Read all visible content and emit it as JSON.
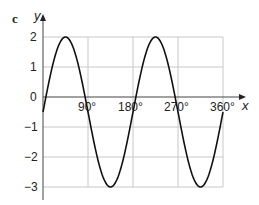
{
  "part_label": "c",
  "chart_data": {
    "type": "line",
    "title": "",
    "xlabel": "x",
    "ylabel": "y",
    "x_ticks": [
      "90°",
      "180°",
      "270°",
      "360°"
    ],
    "y_ticks": [
      "2",
      "1",
      "0",
      "−1",
      "−2",
      "−3"
    ],
    "xlim": [
      0,
      360
    ],
    "ylim": [
      -3,
      2
    ],
    "grid": true,
    "series": [
      {
        "name": "curve",
        "x": [
          0,
          45,
          90,
          135,
          180,
          225,
          270,
          315,
          360
        ],
        "values": [
          -0.5,
          2,
          -0.5,
          -3,
          -0.5,
          2,
          -0.5,
          -3,
          -0.5
        ]
      }
    ]
  }
}
